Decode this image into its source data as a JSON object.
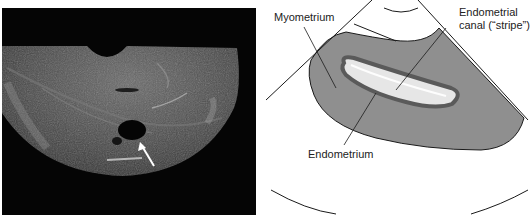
{
  "figure": {
    "left_panel": {
      "type": "transvaginal-ultrasound-image",
      "annotation": "white-arrow"
    },
    "right_panel": {
      "type": "schematic-diagram",
      "labels": {
        "myometrium": "Myometrium",
        "canal_line1": "Endometrial",
        "canal_line2": "canal (“stripe”)",
        "endometrium": "Endometrium"
      },
      "colors": {
        "myometrium": "#8f8f8f",
        "endometrium": "#5a5a5a",
        "canal": "#e6e6e6",
        "outline": "#1a1a1a"
      }
    }
  }
}
